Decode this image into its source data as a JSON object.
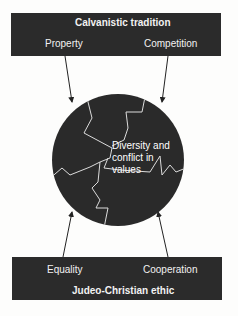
{
  "top": {
    "title": "Calvanistic tradition",
    "left": "Property",
    "right": "Competition"
  },
  "bottom": {
    "title": "Judeo-Christian ethic",
    "left": "Equality",
    "right": "Cooperation"
  },
  "center": {
    "line1": "Diversity and",
    "line2": "conflict in",
    "line3": "values"
  },
  "colors": {
    "box": "#2b2b2b",
    "text": "#f2f2f2",
    "background": "#fdfdfc"
  }
}
